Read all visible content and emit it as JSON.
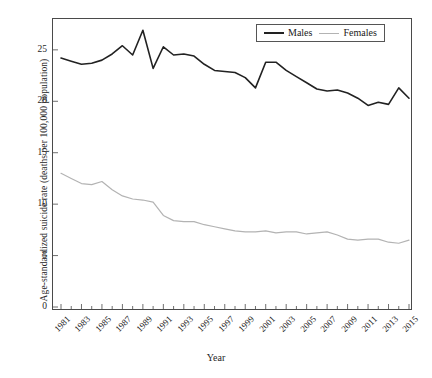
{
  "chart_data": {
    "type": "line",
    "title": "",
    "xlabel": "Year",
    "ylabel": "Age-standardized suicide rate (deaths per 100,000 population)",
    "xlim": [
      1981,
      2015
    ],
    "ylim": [
      0,
      28
    ],
    "grid": false,
    "legend_position": "top-right",
    "x": [
      1981,
      1982,
      1983,
      1984,
      1985,
      1986,
      1987,
      1988,
      1989,
      1990,
      1991,
      1992,
      1993,
      1994,
      1995,
      1996,
      1997,
      1998,
      1999,
      2000,
      2001,
      2002,
      2003,
      2004,
      2005,
      2006,
      2007,
      2008,
      2009,
      2010,
      2011,
      2012,
      2013,
      2014,
      2015
    ],
    "xticks": [
      1981,
      1983,
      1985,
      1987,
      1989,
      1991,
      1993,
      1995,
      1997,
      1999,
      2001,
      2003,
      2005,
      2007,
      2009,
      2011,
      2013,
      2015
    ],
    "xtick_labels": [
      "1981",
      "1983",
      "1985",
      "1987",
      "1989",
      "1991",
      "1993",
      "1995",
      "1997",
      "1999",
      "2001",
      "2003",
      "2005",
      "2007",
      "2009",
      "2011",
      "2013",
      "2015"
    ],
    "yticks": [
      0,
      5,
      10,
      15,
      20,
      25
    ],
    "ytick_labels": [
      "0",
      "5",
      "10",
      "15",
      "20",
      "25"
    ],
    "series": [
      {
        "name": "Males",
        "color": "#222222",
        "width": 1.6,
        "values": [
          24.2,
          23.9,
          23.6,
          23.7,
          24.0,
          24.6,
          25.4,
          24.5,
          26.9,
          23.2,
          25.3,
          24.5,
          24.6,
          24.4,
          23.6,
          23.0,
          22.9,
          22.8,
          22.3,
          21.3,
          23.8,
          23.8,
          23.0,
          22.4,
          21.8,
          21.2,
          21.0,
          21.1,
          20.8,
          20.3,
          19.6,
          19.9,
          19.7,
          21.3,
          20.3
        ]
      },
      {
        "name": "Females",
        "color": "#b3b3b3",
        "width": 1.2,
        "values": [
          13.0,
          12.5,
          12.0,
          11.9,
          12.2,
          11.4,
          10.8,
          10.5,
          10.4,
          10.2,
          8.9,
          8.4,
          8.3,
          8.3,
          8.0,
          7.8,
          7.6,
          7.4,
          7.3,
          7.3,
          7.4,
          7.2,
          7.3,
          7.3,
          7.1,
          7.2,
          7.3,
          7.0,
          6.6,
          6.5,
          6.6,
          6.6,
          6.3,
          6.2,
          6.5
        ]
      }
    ]
  },
  "legend": {
    "items": [
      {
        "label": "Males"
      },
      {
        "label": "Females"
      }
    ]
  },
  "axes": {
    "x_title": "Year",
    "y_title": "Age-standardized suicide rate (deaths per 100,000 population)"
  }
}
